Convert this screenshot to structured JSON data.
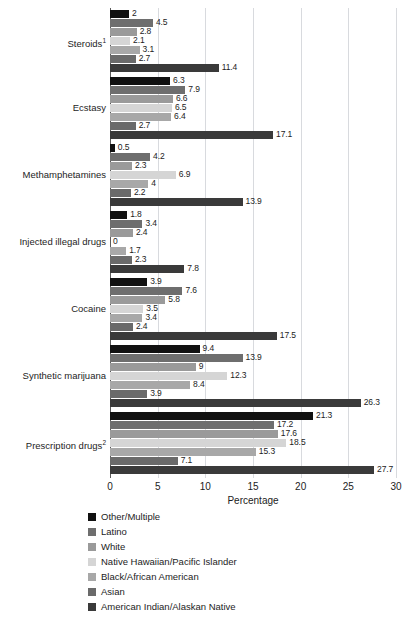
{
  "chart_data": {
    "type": "bar",
    "orientation": "horizontal",
    "title": "",
    "xlabel": "Percentage",
    "ylabel": "",
    "xlim": [
      0,
      30
    ],
    "xticks": [
      0,
      5,
      10,
      15,
      20,
      25,
      30
    ],
    "grid": true,
    "legend_position": "bottom-left",
    "categories": [
      "Steroids¹",
      "Ecstasy",
      "Methamphetamines",
      "Injected illegal drugs",
      "Cocaine",
      "Synthetic marijuana",
      "Prescription drugs²"
    ],
    "series": [
      {
        "name": "Other/Multiple",
        "color": "#111111",
        "values": [
          2,
          6.3,
          0.5,
          1.8,
          3.9,
          9.4,
          21.3
        ],
        "labels": [
          "2",
          "6.3",
          "0.5",
          "1.8",
          "3.9",
          "9.4",
          "21.3"
        ]
      },
      {
        "name": "Latino",
        "color": "#6e6e6e",
        "values": [
          4.5,
          7.9,
          4.2,
          3.4,
          7.6,
          13.9,
          17.2
        ],
        "labels": [
          "4.5",
          "7.9",
          "4.2",
          "3.4",
          "7.6",
          "13.9",
          "17.2"
        ]
      },
      {
        "name": "White",
        "color": "#9a9a9a",
        "values": [
          2.8,
          6.6,
          2.3,
          2.4,
          5.8,
          9,
          17.6
        ],
        "labels": [
          "2.8",
          "6.6",
          "2.3",
          "2.4",
          "5.8",
          "9",
          "17.6"
        ]
      },
      {
        "name": "Native Hawaiian/Pacific Islander",
        "color": "#d5d5d5",
        "values": [
          2.1,
          6.5,
          6.9,
          0,
          3.5,
          12.3,
          18.5
        ],
        "labels": [
          "2.1",
          "6.5",
          "6.9",
          "0",
          "3.5",
          "12.3",
          "18.5"
        ]
      },
      {
        "name": "Black/African American",
        "color": "#a8a8a8",
        "values": [
          3.1,
          6.4,
          4,
          1.7,
          3.4,
          8.4,
          15.3
        ],
        "labels": [
          "3.1",
          "6.4",
          "4",
          "1.7",
          "3.4",
          "8.4",
          "15.3"
        ]
      },
      {
        "name": "Asian",
        "color": "#6a6a6a",
        "values": [
          2.7,
          2.7,
          2.2,
          2.3,
          2.4,
          3.9,
          7.1
        ],
        "labels": [
          "2.7",
          "2.7",
          "2.2",
          "2.3",
          "2.4",
          "3.9",
          "7.1"
        ]
      },
      {
        "name": "American Indian/Alaskan Native",
        "color": "#3a3a3a",
        "values": [
          11.4,
          17.1,
          13.9,
          7.8,
          17.5,
          26.3,
          27.7
        ],
        "labels": [
          "11.4",
          "17.1",
          "13.9",
          "7.8",
          "17.5",
          "26.3",
          "27.7"
        ]
      }
    ]
  },
  "axis": {
    "tick_labels": [
      "0",
      "5",
      "10",
      "15",
      "20",
      "25",
      "30"
    ],
    "title": "Percentage"
  },
  "colors": {
    "gridline": "#d8dade",
    "axis": "#5a5a5a",
    "text": "#1c1c1c",
    "background": "#ffffff"
  }
}
